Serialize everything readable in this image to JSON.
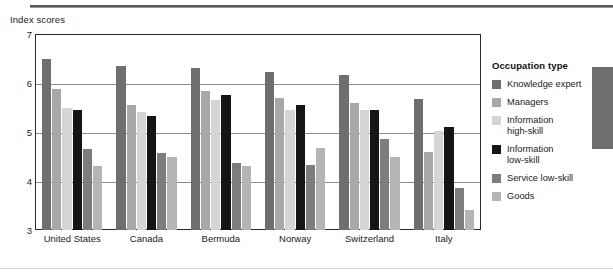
{
  "axis_title": "Index scores",
  "legend": {
    "title": "Occupation type"
  },
  "chart_data": {
    "type": "bar",
    "title": "",
    "subtitle": "",
    "xlabel": "",
    "ylabel": "Index scores",
    "ylim": [
      3,
      7
    ],
    "yticks": [
      3,
      4,
      5,
      6,
      7
    ],
    "ytick_labels": [
      "3",
      "4",
      "5",
      "6",
      "7"
    ],
    "grid": true,
    "gridlines_at": [
      4,
      5,
      6
    ],
    "legend_position": "right",
    "legend_title": "Occupation type",
    "categories": [
      "United States",
      "Canada",
      "Bermuda",
      "Norway",
      "Switzerland",
      "Italy"
    ],
    "series": [
      {
        "name": "Knowledge expert",
        "color": "#6f6f6f",
        "values": [
          6.5,
          6.35,
          6.3,
          6.23,
          6.17,
          5.68
        ]
      },
      {
        "name": "Managers",
        "color": "#a8a8a8",
        "values": [
          5.88,
          5.55,
          5.83,
          5.7,
          5.6,
          4.6
        ]
      },
      {
        "name": "Information\nhigh-skill",
        "color": "#d5d5d5",
        "values": [
          5.5,
          5.4,
          5.65,
          5.45,
          5.45,
          5.02
        ]
      },
      {
        "name": "Information\nlow-skill",
        "color": "#151515",
        "values": [
          5.45,
          5.33,
          5.75,
          5.55,
          5.45,
          5.1
        ]
      },
      {
        "name": "Service low-skill",
        "color": "#7d7d7d",
        "values": [
          4.65,
          4.58,
          4.37,
          4.33,
          4.85,
          3.85
        ]
      },
      {
        "name": "Goods",
        "color": "#b5b5b5",
        "values": [
          4.3,
          4.5,
          4.3,
          4.68,
          4.5,
          3.4
        ]
      }
    ]
  }
}
